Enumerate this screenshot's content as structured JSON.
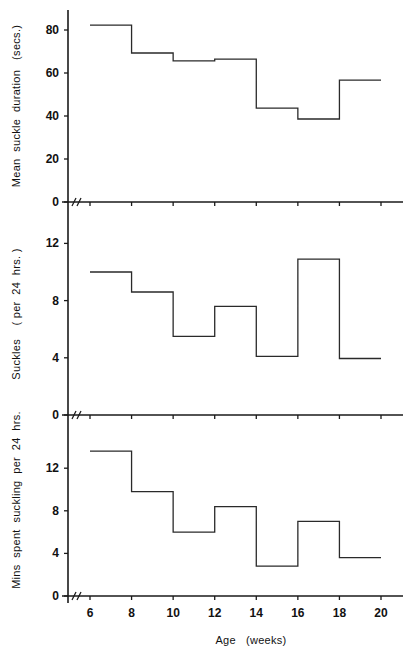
{
  "chart_data": [
    {
      "type": "line",
      "style": "step",
      "title": "",
      "xlabel": "",
      "ylabel": "Mean  suckle  duration   (secs.)",
      "x_edges": [
        6,
        8,
        10,
        12,
        14,
        16,
        18,
        20
      ],
      "values": [
        82.3,
        69.3,
        65.6,
        66.5,
        43.7,
        38.6,
        56.7
      ],
      "yticks": [
        0,
        20,
        40,
        60,
        80
      ],
      "ylim": [
        0,
        90
      ],
      "grid": false,
      "axis_break": true
    },
    {
      "type": "line",
      "style": "step",
      "title": "",
      "xlabel": "",
      "ylabel": "Suckles    ( per  24  hrs. )",
      "x_edges": [
        6,
        8,
        10,
        12,
        14,
        16,
        18,
        20
      ],
      "values": [
        10.0,
        8.6,
        5.5,
        7.6,
        4.1,
        10.9,
        3.95
      ],
      "yticks": [
        0,
        4,
        8,
        12
      ],
      "ylim": [
        0,
        14
      ],
      "grid": false,
      "axis_break": true
    },
    {
      "type": "line",
      "style": "step",
      "title": "",
      "xlabel": "Age   (weeks)",
      "ylabel": "Mins  spent  suckling  per  24  hrs.",
      "x_edges": [
        6,
        8,
        10,
        12,
        14,
        16,
        18,
        20
      ],
      "values": [
        13.6,
        9.8,
        6.0,
        8.4,
        2.8,
        7.0,
        3.6
      ],
      "yticks": [
        0,
        4,
        8,
        12
      ],
      "ylim": [
        0,
        14.8
      ],
      "grid": false,
      "axis_break": true
    }
  ],
  "shared_x": {
    "ticks": [
      6,
      8,
      10,
      12,
      14,
      16,
      18,
      20
    ],
    "tick_labels": [
      "6",
      "8",
      "10",
      "12",
      "14",
      "16",
      "18",
      "20"
    ],
    "label": "Age   (weeks)"
  },
  "colors": {
    "line": "#2a2a2a",
    "axis": "#1a1a1a",
    "background": "#ffffff"
  }
}
